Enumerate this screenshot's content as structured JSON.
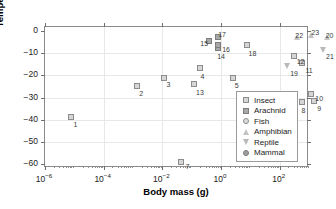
{
  "chart_data": {
    "type": "scatter",
    "title": "",
    "xlabel": "Body mass (g)",
    "ylabel": "Temperature of crystallisation (°C)",
    "xscale": "log",
    "xlim": [
      1e-06,
      1000
    ],
    "ylim": [
      -62,
      2
    ],
    "grid": true,
    "xticks": [
      {
        "value": 1e-06,
        "label_base": "10",
        "label_exp": "-6"
      },
      {
        "value": 0.0001,
        "label_base": "10",
        "label_exp": "-4"
      },
      {
        "value": 0.01,
        "label_base": "10",
        "label_exp": "-2"
      },
      {
        "value": 1,
        "label_base": "10",
        "label_exp": "0"
      },
      {
        "value": 100,
        "label_base": "10",
        "label_exp": "2"
      }
    ],
    "yticks": [
      {
        "value": 0,
        "label": "0"
      },
      {
        "value": -10,
        "label": "−10"
      },
      {
        "value": -20,
        "label": "−20"
      },
      {
        "value": -30,
        "label": "−30"
      },
      {
        "value": -40,
        "label": "−40"
      },
      {
        "value": -50,
        "label": "−50"
      },
      {
        "value": -60,
        "label": "−60"
      }
    ],
    "legend": {
      "position": "bottom-right",
      "entries": [
        {
          "label": "Insect",
          "marker": "square-open",
          "key": "insect"
        },
        {
          "label": "Arachnid",
          "marker": "square-filled",
          "key": "arachnid"
        },
        {
          "label": "Fish",
          "marker": "circle-open",
          "key": "fish"
        },
        {
          "label": "Amphibian",
          "marker": "triangle-up",
          "key": "amphibian"
        },
        {
          "label": "Reptile",
          "marker": "triangle-down",
          "key": "reptile"
        },
        {
          "label": "Mammal",
          "marker": "circle-filled",
          "key": "mammal"
        }
      ]
    },
    "points": [
      {
        "id": "1",
        "group": "insect",
        "x": 8e-06,
        "y": -39.0,
        "lx": 2,
        "ly": 4
      },
      {
        "id": "2",
        "group": "insect",
        "x": 0.0014,
        "y": -25.0,
        "lx": 2,
        "ly": 4
      },
      {
        "id": "3",
        "group": "insect",
        "x": 0.011,
        "y": -21.0,
        "lx": 3,
        "ly": 3
      },
      {
        "id": "4",
        "group": "insect",
        "x": 0.2,
        "y": -16.5,
        "lx": 0,
        "ly": 5
      },
      {
        "id": "5",
        "group": "insect",
        "x": 2.5,
        "y": -21.0,
        "lx": 2,
        "ly": 4
      },
      {
        "id": "6",
        "group": "insect",
        "x": 50.0,
        "y": -38.0,
        "lx": 3,
        "ly": 3
      },
      {
        "id": "7",
        "group": "insect",
        "x": 0.045,
        "y": -59.5,
        "lx": 4,
        "ly": 1
      },
      {
        "id": "8",
        "group": "insect",
        "x": 600.0,
        "y": -32.0,
        "lx": -1,
        "ly": 5
      },
      {
        "id": "9",
        "group": "insect",
        "x": 1500.0,
        "y": -31.5,
        "lx": 3,
        "ly": 4
      },
      {
        "id": "10",
        "group": "insect",
        "x": 1200.0,
        "y": -28.5,
        "lx": 4,
        "ly": 1
      },
      {
        "id": "11",
        "group": "insect",
        "x": 600.0,
        "y": -14.5,
        "lx": 3,
        "ly": 4
      },
      {
        "id": "12",
        "group": "insect",
        "x": 300.0,
        "y": -11.0,
        "lx": 3,
        "ly": 2
      },
      {
        "id": "13",
        "group": "insect",
        "x": 0.12,
        "y": -24.0,
        "lx": 2,
        "ly": 5
      },
      {
        "id": "14",
        "group": "arachnid",
        "x": 0.8,
        "y": -7.5,
        "lx": -1,
        "ly": 5
      },
      {
        "id": "15",
        "group": "arachnid",
        "x": 0.4,
        "y": -4.5,
        "lx": -9,
        "ly": -1
      },
      {
        "id": "16",
        "group": "arachnid",
        "x": 0.8,
        "y": -6.0,
        "lx": 4,
        "ly": 1
      },
      {
        "id": "17",
        "group": "arachnid",
        "x": 0.8,
        "y": -2.5,
        "lx": 0,
        "ly": -6
      },
      {
        "id": "18",
        "group": "insect",
        "x": 8.0,
        "y": -6.0,
        "lx": 1,
        "ly": 5
      },
      {
        "id": "19",
        "group": "reptile",
        "x": 180.0,
        "y": -15.5,
        "lx": 3,
        "ly": 4
      },
      {
        "id": "20",
        "group": "amphibian",
        "x": 4000.0,
        "y": -2.5,
        "lx": -1,
        "ly": -5
      },
      {
        "id": "21",
        "group": "reptile",
        "x": 3000.0,
        "y": -8.5,
        "lx": 3,
        "ly": 3
      },
      {
        "id": "22",
        "group": "amphibian",
        "x": 400.0,
        "y": -2.5,
        "lx": -2,
        "ly": -5
      },
      {
        "id": "23",
        "group": "amphibian",
        "x": 1200.0,
        "y": -1.5,
        "lx": 0,
        "ly": -6
      },
      {
        "id": "24",
        "group": "reptile",
        "x": 15000.0,
        "y": -2.5,
        "lx": -1,
        "ly": 5
      },
      {
        "id": "25",
        "group": "reptile",
        "x": 40000.0,
        "y": -1.5,
        "lx": 3,
        "ly": 4
      },
      {
        "id": "26",
        "group": "mammal",
        "x": 1000000.0,
        "y": -2.0,
        "lx": 1,
        "ly": 5
      },
      {
        "id": "27",
        "group": "reptile",
        "x": 200000000.0,
        "y": -1.0,
        "lx": -3,
        "ly": -5
      },
      {
        "id": "28",
        "group": "reptile",
        "x": 600000000.0,
        "y": -2.5,
        "lx": 1,
        "ly": 5
      },
      {
        "id": "29",
        "group": "reptile",
        "x": 5000000000.0,
        "y": -1.0,
        "lx": 0,
        "ly": -5
      },
      {
        "id": "30",
        "group": "mammal",
        "x": 20000000000.0,
        "y": -3.5,
        "lx": 1,
        "ly": 5
      }
    ]
  }
}
